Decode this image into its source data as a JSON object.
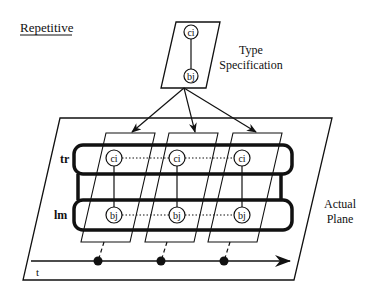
{
  "title": "Repetitive",
  "type_spec": {
    "label_line1": "Type",
    "label_line2": "Specification",
    "node_top": "ci",
    "node_bottom": "bj"
  },
  "plane": {
    "label_line1": "Actual",
    "label_line2": "Plane"
  },
  "bands": {
    "top_label": "tr",
    "bottom_label": "lm"
  },
  "instances": [
    {
      "top": "ci",
      "bottom": "bj"
    },
    {
      "top": "ci",
      "bottom": "bj"
    },
    {
      "top": "ci",
      "bottom": "bj"
    }
  ],
  "timeline": {
    "label": "t",
    "event_count": 3
  },
  "colors": {
    "stroke": "#111111",
    "background": "#ffffff"
  }
}
